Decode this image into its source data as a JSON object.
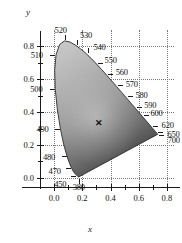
{
  "figure": {
    "type": "chromaticity-diagram",
    "xlabel": "x",
    "ylabel": "y"
  },
  "chart_data": {
    "type": "scatter",
    "title": "",
    "subtitle": "",
    "xlabel": "x",
    "ylabel": "y",
    "xlim": [
      -0.1,
      0.85
    ],
    "ylim": [
      -0.05,
      0.9
    ],
    "grid": true,
    "grid_style": "dotted",
    "legend": "none",
    "xticks": [
      0.0,
      0.2,
      0.4,
      0.6,
      0.8
    ],
    "xticklabels": [
      "0.0",
      "0.2",
      "0.4",
      "0.6",
      "0.8"
    ],
    "yticks": [
      0.0,
      0.2,
      0.4,
      0.6,
      0.8
    ],
    "yticklabels": [
      "0.0",
      "0.2",
      "0.4",
      "0.6",
      "0.8"
    ],
    "xminorticks": [
      0.1,
      0.3,
      0.5,
      0.7
    ],
    "yminorticks": [
      0.1,
      0.3,
      0.5,
      0.7
    ],
    "annotations": [
      {
        "label": "520",
        "x": 0.0743,
        "y": 0.8338
      },
      {
        "label": "530",
        "x": 0.1547,
        "y": 0.8059
      },
      {
        "label": "540",
        "x": 0.2296,
        "y": 0.7543
      },
      {
        "label": "550",
        "x": 0.3016,
        "y": 0.6923
      },
      {
        "label": "560",
        "x": 0.3731,
        "y": 0.6245
      },
      {
        "label": "570",
        "x": 0.4441,
        "y": 0.5547
      },
      {
        "label": "580",
        "x": 0.5125,
        "y": 0.4866
      },
      {
        "label": "590",
        "x": 0.5752,
        "y": 0.4242
      },
      {
        "label": "600",
        "x": 0.627,
        "y": 0.3725
      },
      {
        "label": "620",
        "x": 0.6915,
        "y": 0.3083
      },
      {
        "label": "650",
        "x": 0.726,
        "y": 0.274
      },
      {
        "label": "700",
        "x": 0.7347,
        "y": 0.2653
      },
      {
        "label": "510",
        "x": 0.0114,
        "y": 0.75
      },
      {
        "label": "500",
        "x": 0.0082,
        "y": 0.5384
      },
      {
        "label": "490",
        "x": 0.0454,
        "y": 0.295
      },
      {
        "label": "480",
        "x": 0.0913,
        "y": 0.1327
      },
      {
        "label": "470",
        "x": 0.1241,
        "y": 0.0578
      },
      {
        "label": "450",
        "x": 0.1566,
        "y": 0.0177
      },
      {
        "label": "380",
        "x": 0.1741,
        "y": 0.005
      }
    ],
    "points": [
      {
        "label": "white-point",
        "marker": "x",
        "x": 0.31,
        "y": 0.33
      }
    ],
    "spectral_locus": [
      [
        0.1741,
        0.005
      ],
      [
        0.174,
        0.005
      ],
      [
        0.1738,
        0.0049
      ],
      [
        0.1736,
        0.0049
      ],
      [
        0.1733,
        0.0048
      ],
      [
        0.173,
        0.0048
      ],
      [
        0.1726,
        0.0048
      ],
      [
        0.1721,
        0.0048
      ],
      [
        0.1714,
        0.0051
      ],
      [
        0.1703,
        0.0058
      ],
      [
        0.1689,
        0.0069
      ],
      [
        0.1669,
        0.0086
      ],
      [
        0.1644,
        0.0109
      ],
      [
        0.1611,
        0.0138
      ],
      [
        0.1566,
        0.0177
      ],
      [
        0.151,
        0.0227
      ],
      [
        0.144,
        0.0297
      ],
      [
        0.1355,
        0.0399
      ],
      [
        0.1241,
        0.0578
      ],
      [
        0.1096,
        0.0868
      ],
      [
        0.0913,
        0.1327
      ],
      [
        0.0687,
        0.2007
      ],
      [
        0.0454,
        0.295
      ],
      [
        0.0235,
        0.4127
      ],
      [
        0.0082,
        0.5384
      ],
      [
        0.0039,
        0.6548
      ],
      [
        0.0139,
        0.7502
      ],
      [
        0.0389,
        0.812
      ],
      [
        0.0743,
        0.8338
      ],
      [
        0.1142,
        0.8262
      ],
      [
        0.1547,
        0.8059
      ],
      [
        0.1929,
        0.7816
      ],
      [
        0.2296,
        0.7543
      ],
      [
        0.2658,
        0.7243
      ],
      [
        0.3016,
        0.6923
      ],
      [
        0.3373,
        0.6589
      ],
      [
        0.3731,
        0.6245
      ],
      [
        0.4087,
        0.5896
      ],
      [
        0.4441,
        0.5547
      ],
      [
        0.4788,
        0.5202
      ],
      [
        0.5125,
        0.4866
      ],
      [
        0.5448,
        0.4544
      ],
      [
        0.5752,
        0.4242
      ],
      [
        0.6029,
        0.3965
      ],
      [
        0.627,
        0.3725
      ],
      [
        0.6482,
        0.3514
      ],
      [
        0.6658,
        0.334
      ],
      [
        0.6801,
        0.3197
      ],
      [
        0.6915,
        0.3083
      ],
      [
        0.7006,
        0.2993
      ],
      [
        0.7079,
        0.292
      ],
      [
        0.714,
        0.2859
      ],
      [
        0.719,
        0.2809
      ],
      [
        0.723,
        0.277
      ],
      [
        0.726,
        0.274
      ],
      [
        0.7283,
        0.2717
      ],
      [
        0.73,
        0.27
      ],
      [
        0.7311,
        0.2689
      ],
      [
        0.732,
        0.268
      ],
      [
        0.7327,
        0.2673
      ],
      [
        0.7334,
        0.2666
      ],
      [
        0.734,
        0.266
      ],
      [
        0.7344,
        0.2656
      ],
      [
        0.7346,
        0.2654
      ],
      [
        0.7347,
        0.2653
      ]
    ]
  }
}
